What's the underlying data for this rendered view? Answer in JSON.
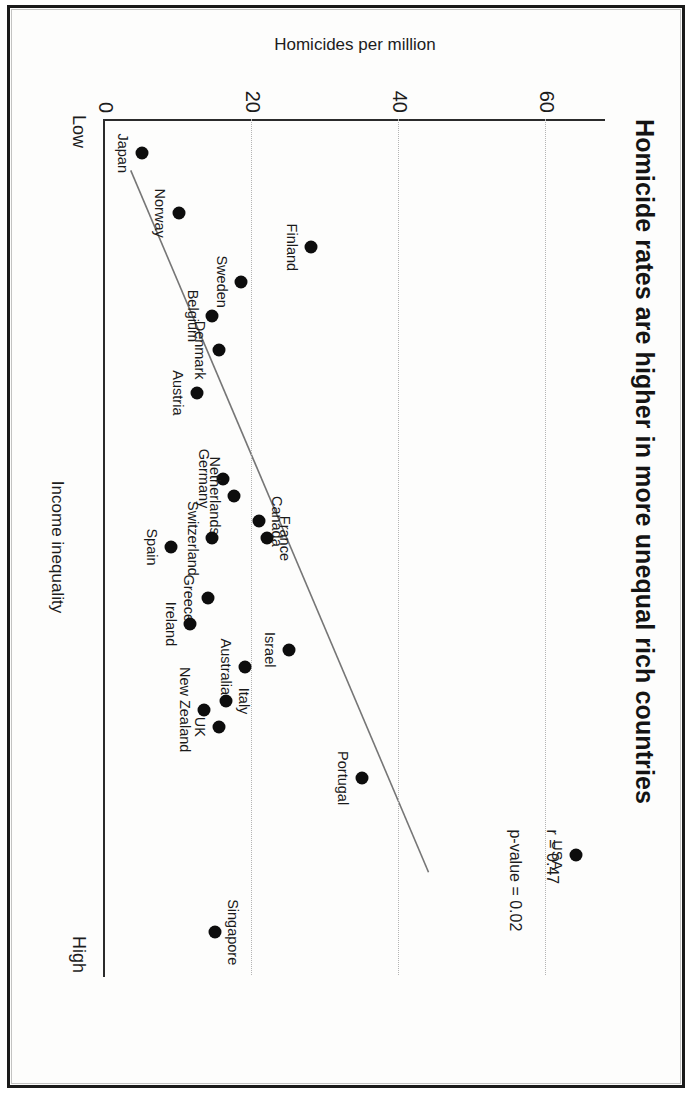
{
  "figure": {
    "title": "Homicide rates are higher in more unequal rich countries",
    "annotations": {
      "r": "r = 0.47",
      "p": "p-value = 0.02"
    }
  },
  "chart_data": {
    "type": "scatter",
    "title": "Homicide rates are higher in more unequal rich countries",
    "xlabel": "Income inequality",
    "ylabel": "Homicides per million",
    "x_tick_labels": [
      "Low",
      "High"
    ],
    "y_ticks": [
      0,
      20,
      40,
      60
    ],
    "y_tick_labels": [
      "0",
      "20",
      "40",
      "60"
    ],
    "ylim": [
      0,
      68
    ],
    "xlim": [
      0,
      100
    ],
    "grid": "dotted horizontal gridlines at y = 20, 40, 60",
    "legend": "none",
    "orientation_note": "figure rendered rotated 90 degrees clockwise in the screenshot",
    "annotations": [
      {
        "text": "r = 0.47",
        "x": 83,
        "y": 62
      },
      {
        "text": "p-value = 0.02",
        "x": 83,
        "y": 57
      }
    ],
    "trendline": {
      "type": "linear fit",
      "x_start": 6,
      "y_start": 3.5,
      "x_end": 88,
      "y_end": 44,
      "color": "#767676"
    },
    "points": [
      {
        "label": "Japan",
        "x": 4,
        "y": 5,
        "label_pos": "below"
      },
      {
        "label": "Norway",
        "x": 11,
        "y": 10,
        "label_pos": "below"
      },
      {
        "label": "Finland",
        "x": 15,
        "y": 28,
        "label_pos": "below"
      },
      {
        "label": "Sweden",
        "x": 19,
        "y": 18.5,
        "label_pos": "below"
      },
      {
        "label": "Belgium",
        "x": 23,
        "y": 14.5,
        "label_pos": "below"
      },
      {
        "label": "Denmark",
        "x": 27,
        "y": 15.5,
        "label_pos": "below"
      },
      {
        "label": "Austria",
        "x": 32,
        "y": 12.5,
        "label_pos": "below"
      },
      {
        "label": "Germany",
        "x": 42,
        "y": 16,
        "label_pos": "below"
      },
      {
        "label": "Netherlands",
        "x": 44,
        "y": 17.5,
        "label_pos": "below"
      },
      {
        "label": "Canada",
        "x": 47,
        "y": 21,
        "label_pos": "above"
      },
      {
        "label": "France",
        "x": 49,
        "y": 22,
        "label_pos": "above"
      },
      {
        "label": "Switzerland",
        "x": 49,
        "y": 14.5,
        "label_pos": "below"
      },
      {
        "label": "Spain",
        "x": 50,
        "y": 9,
        "label_pos": "below"
      },
      {
        "label": "Greece",
        "x": 56,
        "y": 14,
        "label_pos": "below"
      },
      {
        "label": "Ireland",
        "x": 59,
        "y": 11.5,
        "label_pos": "below"
      },
      {
        "label": "Israel",
        "x": 62,
        "y": 25,
        "label_pos": "below"
      },
      {
        "label": "Australia",
        "x": 64,
        "y": 19,
        "label_pos": "below"
      },
      {
        "label": "Italy",
        "x": 68,
        "y": 16.5,
        "label_pos": "above"
      },
      {
        "label": "New Zealand",
        "x": 69,
        "y": 13.5,
        "label_pos": "below"
      },
      {
        "label": "UK",
        "x": 71,
        "y": 15.5,
        "label_pos": "below"
      },
      {
        "label": "Portugal",
        "x": 77,
        "y": 35,
        "label_pos": "below"
      },
      {
        "label": "USA",
        "x": 86,
        "y": 64,
        "label_pos": "below"
      },
      {
        "label": "Singapore",
        "x": 95,
        "y": 15,
        "label_pos": "above"
      }
    ]
  }
}
